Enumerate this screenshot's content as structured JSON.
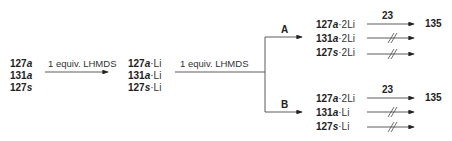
{
  "scheme": {
    "starting_materials": [
      {
        "num": "127",
        "letter": "a",
        "suffix": ""
      },
      {
        "num": "131",
        "letter": "a",
        "suffix": ""
      },
      {
        "num": "127",
        "letter": "s",
        "suffix": ""
      }
    ],
    "step1_reagent": "1 equiv. LHMDS",
    "mono_lithiated": [
      {
        "num": "127",
        "letter": "a",
        "suffix": "·Li"
      },
      {
        "num": "131",
        "letter": "a",
        "suffix": "·Li"
      },
      {
        "num": "127",
        "letter": "s",
        "suffix": "·Li"
      }
    ],
    "step2_reagent": "1 equiv. LHMDS",
    "branch_A": {
      "label": "A",
      "species": [
        {
          "num": "127",
          "letter": "a",
          "suffix": "·2Li"
        },
        {
          "num": "131",
          "letter": "a",
          "suffix": "·2Li"
        },
        {
          "num": "127",
          "letter": "s",
          "suffix": "·2Li"
        }
      ],
      "reagent": "23",
      "product": "135",
      "blocked": [
        false,
        true,
        true
      ]
    },
    "branch_B": {
      "label": "B",
      "species": [
        {
          "num": "127",
          "letter": "a",
          "suffix": "·2Li"
        },
        {
          "num": "131",
          "letter": "a",
          "suffix": "·Li"
        },
        {
          "num": "127",
          "letter": "s",
          "suffix": "·Li"
        }
      ],
      "reagent": "23",
      "product": "135",
      "blocked": [
        false,
        true,
        true
      ]
    }
  }
}
